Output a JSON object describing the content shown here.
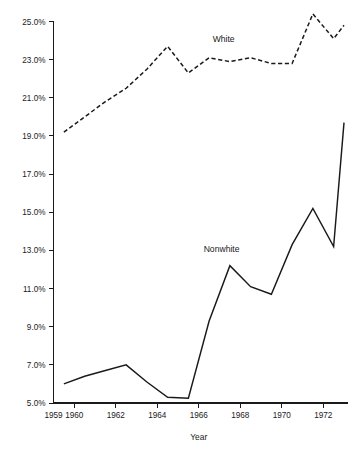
{
  "chart_data": {
    "type": "line",
    "title": "",
    "xlabel": "Year",
    "ylabel": "",
    "xlim": [
      1959,
      1973
    ],
    "ylim": [
      5.0,
      25.0
    ],
    "grid": false,
    "legend_position": "inline-annotation",
    "x_tick_labels": [
      "1959",
      "1960",
      "1962",
      "1964",
      "1966",
      "1968",
      "1970",
      "1972"
    ],
    "x_tick_values": [
      1959,
      1960,
      1962,
      1964,
      1966,
      1968,
      1970,
      1972
    ],
    "y_tick_labels": [
      "25.0%",
      "23.0%",
      "21.0%",
      "19.0%",
      "17.0%",
      "15.0%",
      "13.0%",
      "11.0%",
      "9.0%",
      "7.0%",
      "5.0%"
    ],
    "y_tick_values": [
      25.0,
      23.0,
      21.0,
      19.0,
      17.0,
      15.0,
      13.0,
      11.0,
      9.0,
      7.0,
      5.0
    ],
    "x": [
      1959.5,
      1960.5,
      1961.5,
      1962.5,
      1963.5,
      1964.5,
      1965.5,
      1966.5,
      1967.5,
      1968.5,
      1969.5,
      1970.5,
      1971.5,
      1972.5,
      1973.0
    ],
    "series": [
      {
        "name": "White",
        "style": "dashed",
        "color": "#1a1a1a",
        "label_x": 1967.2,
        "label_y": 23.9,
        "values": [
          19.2,
          20.0,
          20.8,
          21.5,
          22.5,
          23.7,
          22.3,
          23.1,
          22.9,
          23.1,
          22.8,
          22.8,
          25.4,
          24.1,
          24.8
        ]
      },
      {
        "name": "Nonwhite",
        "style": "solid",
        "color": "#1a1a1a",
        "label_x": 1967.1,
        "label_y": 12.9,
        "values": [
          6.0,
          6.4,
          6.7,
          7.0,
          6.1,
          5.3,
          5.25,
          9.3,
          12.2,
          11.1,
          10.7,
          13.3,
          15.2,
          13.2,
          19.7
        ]
      }
    ]
  },
  "labels": {
    "series_white": "White",
    "series_nonwhite": "Nonwhite",
    "x_axis_title": "Year"
  }
}
